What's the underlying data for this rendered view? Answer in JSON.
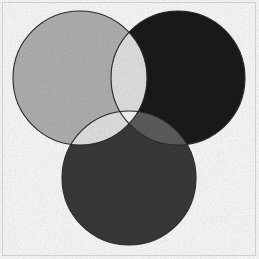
{
  "figure": {
    "width": 259,
    "height": 259,
    "background_color": "#ffffff",
    "border_color": "#cfcfcf"
  },
  "chart_data": {
    "type": "venn",
    "xlabel": "",
    "ylabel": "",
    "grid": false,
    "legend": "none",
    "annotations": [],
    "set_count": 3,
    "radius": 67,
    "outline_color": "#2b2b2b",
    "outline_width": 1.1,
    "sets": [
      {
        "id": "A",
        "name": "set-a-light-gray",
        "position": "top-left",
        "cx": 80,
        "cy": 78,
        "r": 67,
        "color": "#b4b4b4",
        "label": ""
      },
      {
        "id": "B",
        "name": "set-b-black",
        "position": "top-right",
        "cx": 178,
        "cy": 78,
        "r": 67,
        "color": "#1a1a1a",
        "label": ""
      },
      {
        "id": "C",
        "name": "set-c-dark-gray",
        "position": "bottom-center",
        "cx": 129,
        "cy": 178,
        "r": 67,
        "color": "#3a3a3a",
        "label": ""
      }
    ],
    "regions": [
      {
        "id": "A",
        "sets": [
          "A"
        ],
        "color": "#b4b4b4",
        "label": ""
      },
      {
        "id": "B",
        "sets": [
          "B"
        ],
        "color": "#1a1a1a",
        "label": ""
      },
      {
        "id": "C",
        "sets": [
          "C"
        ],
        "color": "#3a3a3a",
        "label": ""
      },
      {
        "id": "AB",
        "sets": [
          "A",
          "B"
        ],
        "color": "#e6e6e6",
        "label": ""
      },
      {
        "id": "AC",
        "sets": [
          "A",
          "C"
        ],
        "color": "#e6e6e6",
        "label": ""
      },
      {
        "id": "BC",
        "sets": [
          "B",
          "C"
        ],
        "color": "#5e5e5e",
        "label": ""
      },
      {
        "id": "ABC",
        "sets": [
          "A",
          "B",
          "C"
        ],
        "color": "#fbfbfb",
        "label": ""
      }
    ]
  }
}
